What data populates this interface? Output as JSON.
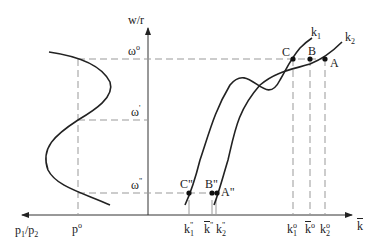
{
  "diagram": {
    "type": "economic-phase-diagram",
    "axes": {
      "vertical_label": "w/r",
      "horizontal_right_label": "k",
      "horizontal_right_label_overbar": true,
      "horizontal_left_label": "p1/p2",
      "horizontal_left_label_parts": {
        "base1": "p",
        "sub1": "1",
        "slash": "/",
        "base2": "p",
        "sub2": "2"
      }
    },
    "omega_levels": [
      {
        "id": "omega0",
        "base": "ω",
        "sup": "o"
      },
      {
        "id": "omega1",
        "base": "ω",
        "sup": "'"
      },
      {
        "id": "omega2",
        "base": "ω",
        "sup": "\""
      }
    ],
    "price_label": {
      "base": "p",
      "sup": "o"
    },
    "curves": [
      {
        "id": "k1",
        "base": "k",
        "sub": "1"
      },
      {
        "id": "k2",
        "base": "k",
        "sub": "2"
      }
    ],
    "points_top": [
      {
        "id": "C",
        "label": "C"
      },
      {
        "id": "B",
        "label": "B"
      },
      {
        "id": "A",
        "label": "A"
      }
    ],
    "points_bottom": [
      {
        "id": "C2",
        "label": "C\""
      },
      {
        "id": "B2",
        "label": "B\""
      },
      {
        "id": "A2",
        "label": "A\""
      }
    ],
    "k_ticks_bottom": [
      {
        "id": "k1pp",
        "base": "k",
        "sub": "1",
        "sup": "\"",
        "overbar": false
      },
      {
        "id": "kbarpp",
        "base": "k",
        "sub": "",
        "sup": "\"",
        "overbar": true
      },
      {
        "id": "k2pp",
        "base": "k",
        "sub": "2",
        "sup": "\"",
        "overbar": false
      }
    ],
    "k_ticks_top": [
      {
        "id": "k1o",
        "base": "k",
        "sub": "1",
        "sup": "o",
        "overbar": false
      },
      {
        "id": "kbaro",
        "base": "k",
        "sub": "",
        "sup": "o",
        "overbar": true
      },
      {
        "id": "k2o",
        "base": "k",
        "sub": "2",
        "sup": "o",
        "overbar": false
      }
    ],
    "colors": {
      "line": "#222222",
      "dash": "#999999",
      "background": "#ffffff"
    }
  }
}
